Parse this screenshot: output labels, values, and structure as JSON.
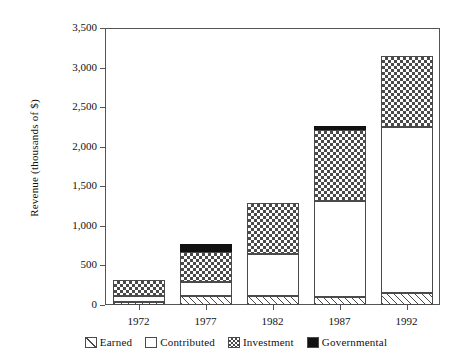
{
  "chart_data": {
    "type": "bar",
    "stacked": true,
    "title": "",
    "xlabel": "",
    "ylabel": "Revenue (thousands of $)",
    "categories": [
      "1972",
      "1977",
      "1982",
      "1987",
      "1992"
    ],
    "ylim": [
      0,
      3500
    ],
    "ytick_labels": [
      "0",
      "500",
      "1,000",
      "1,500",
      "2,000",
      "2,500",
      "3,000",
      "3,500"
    ],
    "ytick_values": [
      0,
      500,
      1000,
      1500,
      2000,
      2500,
      3000,
      3500
    ],
    "grid": false,
    "legend_position": "bottom",
    "series": [
      {
        "name": "Earned",
        "pattern": "diagonal-hatch",
        "values": [
          40,
          120,
          110,
          100,
          150
        ]
      },
      {
        "name": "Contributed",
        "pattern": "blank-white",
        "values": [
          80,
          170,
          540,
          1210,
          2100
        ]
      },
      {
        "name": "Investment",
        "pattern": "checkerboard",
        "values": [
          200,
          380,
          640,
          900,
          900
        ]
      },
      {
        "name": "Governmental",
        "pattern": "solid-black",
        "values": [
          0,
          100,
          0,
          50,
          0
        ]
      }
    ],
    "totals": [
      320,
      770,
      1290,
      2260,
      3150
    ],
    "colors": {
      "ink": "#1a1a1a",
      "axis": "#555555",
      "pattern_ink": "#4a4a4a",
      "governmental": "#111111",
      "background": "#ffffff"
    }
  }
}
